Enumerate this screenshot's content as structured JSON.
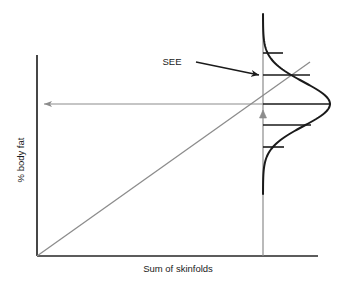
{
  "figure": {
    "type": "statistical-diagram",
    "background_color": "#ffffff"
  },
  "axes": {
    "x_label": "Sum of skinfolds",
    "y_label": "% body fat",
    "axis_color": "#262626",
    "x_axis": {
      "x1": 37,
      "y1": 256,
      "x2": 318,
      "y2": 256
    },
    "y_axis": {
      "x1": 37,
      "y1": 55,
      "x2": 37,
      "y2": 256
    }
  },
  "annotations": {
    "see_label": "SEE",
    "see_arrow_color": "#1a1a1a",
    "projection_arrow_color": "#8c8c8c",
    "marker_color": "#8c8c8c"
  },
  "chart_data": {
    "type": "line",
    "title": "",
    "xlabel": "Sum of skinfolds",
    "ylabel": "% body fat",
    "grid": false,
    "legend": null,
    "xlim": [
      0,
      1
    ],
    "ylim": [
      0,
      1
    ],
    "series": [
      {
        "name": "regression line",
        "type": "line",
        "color": "#8c8c8c",
        "points": [
          [
            37,
            256
          ],
          [
            310,
            62
          ]
        ]
      },
      {
        "name": "normal distribution of residuals",
        "type": "curve",
        "color": "#1a1a1a",
        "orientation": "horizontal",
        "mean_y": 104,
        "sd_px": 22,
        "peak_x": 330,
        "baseline_x": 263,
        "y_top": 14,
        "y_bottom": 194
      },
      {
        "name": "distribution baseline",
        "type": "vline",
        "color": "#8c8c8c",
        "x": 263,
        "y1": 14,
        "y2": 256
      }
    ],
    "sd_ticks": [
      {
        "label": "+2 SD",
        "y": 53,
        "x_start": 263,
        "x_end": 283
      },
      {
        "label": "+1 SD",
        "y": 75,
        "x_start": 263,
        "x_end": 310
      },
      {
        "label": "mean",
        "y": 104,
        "x_start": 263,
        "x_end": 331
      },
      {
        "label": "-1 SD",
        "y": 125,
        "x_start": 263,
        "x_end": 311
      },
      {
        "label": "-2 SD",
        "y": 147,
        "x_start": 263,
        "x_end": 284
      }
    ],
    "projection_arrow": {
      "x_from": 263,
      "x_to": 40,
      "y": 104
    },
    "see_arrow": {
      "x_from": 196,
      "y_from": 62,
      "x_to": 259,
      "y_to": 75
    },
    "see_label_pos": {
      "x": 172,
      "y": 65
    },
    "marker_triangle": {
      "x": 263,
      "y": 116
    }
  }
}
